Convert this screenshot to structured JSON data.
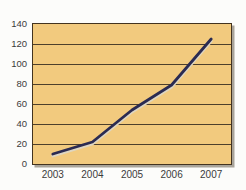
{
  "chart_data": {
    "type": "line",
    "categories": [
      "2003",
      "2004",
      "2005",
      "2006",
      "2007"
    ],
    "series": [
      {
        "name": "series-1",
        "values": [
          10,
          22,
          54,
          79,
          125
        ]
      }
    ],
    "ylim": [
      0,
      140
    ],
    "y_ticks": [
      0,
      20,
      40,
      60,
      80,
      100,
      120,
      140
    ],
    "grid": "horizontal",
    "legend": "none",
    "colors": {
      "page_background": "#fcfcfa",
      "plot_background": "#f2ca7e",
      "plot_border": "#43331f",
      "gridline": "#4d3f2b",
      "line": "#2b2b52",
      "line_highlight": "#ded6c2",
      "tick_label": "#3b3b3b",
      "shadow": "#a9a49a"
    }
  }
}
